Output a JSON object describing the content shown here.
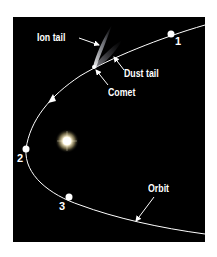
{
  "diagram": {
    "colors": {
      "background": "#000000",
      "page": "#ffffff",
      "orbit": "#ffffff",
      "sun_core": "#fffbe8",
      "sun_glow": "#e8d8a0",
      "ion_tail": "#d8dce8",
      "dust_tail": "#a0a0a8"
    },
    "labels": {
      "ion_tail": "Ion tail",
      "dust_tail": "Dust tail",
      "comet": "Comet",
      "orbit": "Orbit"
    },
    "positions": [
      {
        "id": "1",
        "label": "1"
      },
      {
        "id": "2",
        "label": "2"
      },
      {
        "id": "3",
        "label": "3"
      }
    ],
    "objects": [
      "sun",
      "comet",
      "orbit",
      "ion-tail",
      "dust-tail"
    ]
  }
}
